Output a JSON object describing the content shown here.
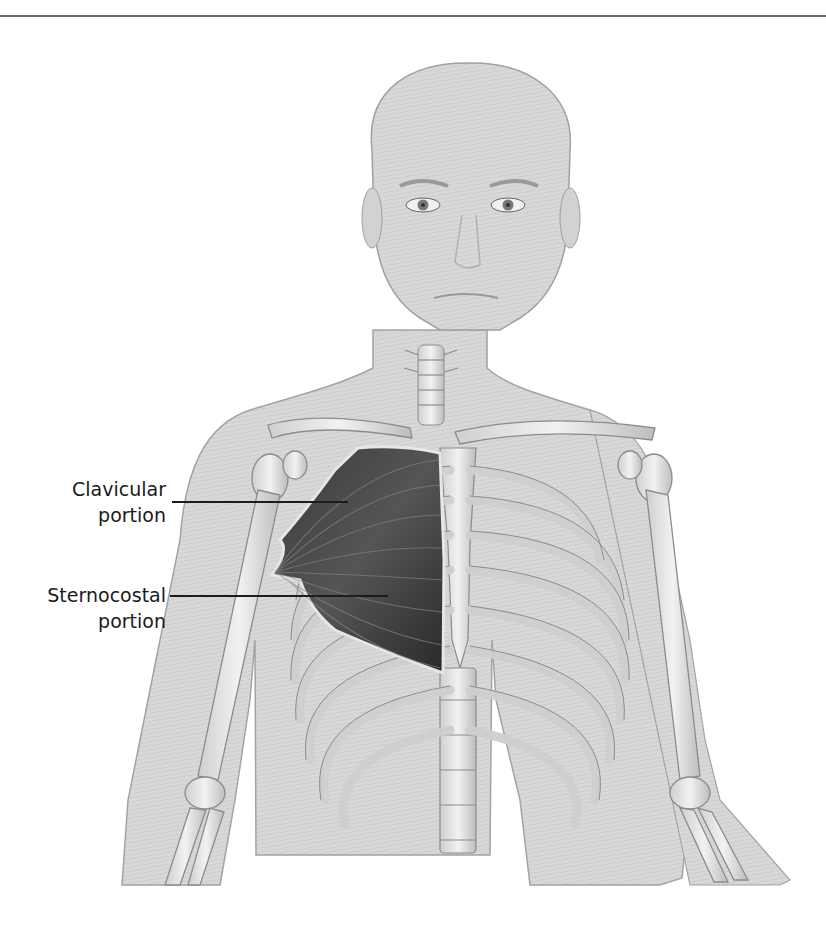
{
  "page": {
    "heading_clipped": "",
    "has_top_rule": true
  },
  "figure": {
    "highlight_muscle": "pectoralis major",
    "colors": {
      "skin": "#d9d9d9",
      "skin_outline": "#9a9a9a",
      "bone": "#e6e6e6",
      "bone_outline": "#8c8c8c",
      "muscle_dark": "#2e2e2e",
      "muscle_mid": "#4a4a4a",
      "label_text": "#1a1a1a",
      "leader_line": "#1c1c1c"
    }
  },
  "labels": [
    {
      "id": "clavicular",
      "line1": "Clavicular",
      "line2": "portion"
    },
    {
      "id": "sternocostal",
      "line1": "Sternocostal",
      "line2": "portion"
    }
  ]
}
